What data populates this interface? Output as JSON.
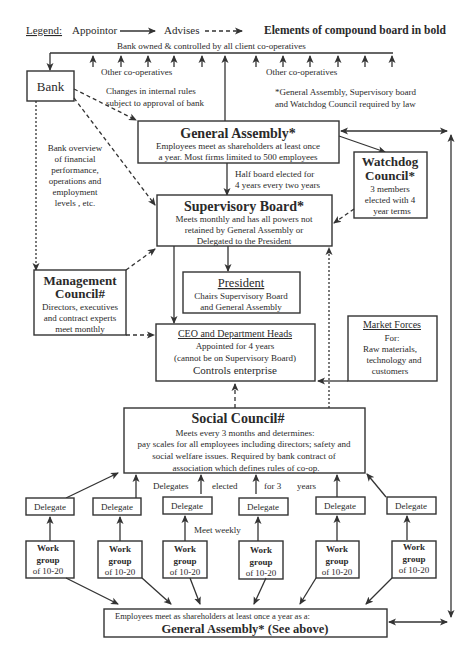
{
  "legend": {
    "label": "Legend:",
    "appointor": "Appointor",
    "advises": "Advises",
    "bold_note": "Elements of compound board in bold"
  },
  "top": {
    "bank_owned": "Bank owned & controlled by all client co-operatives",
    "other_coops_left": "Other co-operatives",
    "other_coops_right": "Other co-operatives",
    "changes_rules_1": "Changes in internal rules",
    "changes_rules_2": "subject to approval of bank",
    "law_note_1": "*General Assembly, Supervisory board",
    "law_note_2": "and Watchdog Council required by law"
  },
  "bank": {
    "title": "Bank"
  },
  "bank_overview": {
    "lines": [
      "Bank overview",
      "of financial",
      "performance,",
      "operations and",
      "employment",
      "levels , etc."
    ]
  },
  "general_assembly": {
    "title": "General Assembly*",
    "line1": "Employees meet as shareholders at least once",
    "line2": "a year. Most firms limited to 500  employees"
  },
  "half_board": {
    "line1": "Half board elected for",
    "line2": "4 years every two years"
  },
  "watchdog": {
    "title1": "Watchdog",
    "title2": "Council*",
    "line1": "3  members",
    "line2": "elected with 4",
    "line3": "year terms"
  },
  "supervisory_board": {
    "title": "Supervisory Board*",
    "line1": "Meets monthly and has all powers not",
    "line2": "retained by General Assembly or",
    "line3": "Delegated to the President"
  },
  "management_council": {
    "title1": "Management",
    "title2": "Council#",
    "line1": "Directors, executives",
    "line2": "and contract experts",
    "line3": "meet monthly"
  },
  "president": {
    "title": "President",
    "line1": "Chairs Supervisory Board",
    "line2": "and General Assembly"
  },
  "ceo": {
    "title": "CEO and Department Heads",
    "line1": "Appointed for 4 years",
    "line2": "(cannot be on Supervisory Board)",
    "line3": "Controls enterprise"
  },
  "market_forces": {
    "title": "Market Forces",
    "line1": "For:",
    "line2": "Raw materials,",
    "line3": "technology and",
    "line4": "customers"
  },
  "social_council": {
    "title": "Social Council#",
    "line1": "Meets every 3 months  and  determines:",
    "line2": "pay scales for all employees including directors; safety and",
    "line3": "social welfare issues. Required by bank contract of",
    "line4": "association which defines rules of co-op."
  },
  "delegates_elected": {
    "w1": "Delegates",
    "w2": "elected",
    "w3": "for  3",
    "w4": "years"
  },
  "meet_weekly": "Meet weekly",
  "delegates": [
    "Delegate",
    "Delegate",
    "Delegate",
    "Delegate",
    "Delegate",
    "Delegate"
  ],
  "work_groups": [
    {
      "l1": "Work",
      "l2": "group",
      "l3": "of 10-20"
    },
    {
      "l1": "Work",
      "l2": "group",
      "l3": "of 10-20"
    },
    {
      "l1": "Work",
      "l2": "group",
      "l3": "of 10-20"
    },
    {
      "l1": "Work",
      "l2": "group",
      "l3": "of 10-20"
    },
    {
      "l1": "Work",
      "l2": "group",
      "l3": "of 10-20"
    },
    {
      "l1": "Work",
      "l2": "group",
      "l3": "of 10-20"
    }
  ],
  "bottom_assembly": {
    "line1": "Employees meet as  shareholders  at least once a year as a:",
    "title": "General Assembly* (See above)"
  }
}
